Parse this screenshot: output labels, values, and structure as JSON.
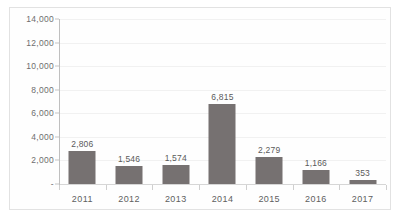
{
  "chart_data": {
    "type": "bar",
    "title": "",
    "subtitle": "",
    "xlabel": "",
    "ylabel": "",
    "categories": [
      "2011",
      "2012",
      "2013",
      "2014",
      "2015",
      "2016",
      "2017"
    ],
    "values": [
      2806,
      1546,
      1574,
      6815,
      2279,
      1166,
      353
    ],
    "data_labels": [
      "2,806",
      "1,546",
      "1,574",
      "6,815",
      "2,279",
      "1,166",
      "353"
    ],
    "ylim": [
      0,
      14000
    ],
    "y_ticks": [
      0,
      2000,
      4000,
      6000,
      8000,
      10000,
      12000,
      14000
    ],
    "y_tick_labels": [
      "-",
      "2,000",
      "4,000",
      "6,000",
      "8,000",
      "10,000",
      "12,000",
      "14,000"
    ],
    "grid": true,
    "legend": "none",
    "series": [
      {
        "name": "",
        "values": [
          2806,
          1546,
          1574,
          6815,
          2279,
          1166,
          353
        ]
      }
    ],
    "colors": {
      "bar": "#767171",
      "gridline": "#f1f1f1",
      "axis": "#bfbfbf",
      "baseline": "#d6d6d6",
      "tick_label": "#6e6e6e",
      "data_label": "#5a5a5a",
      "border": "#e2e2e2",
      "background": "#fefefe"
    }
  }
}
